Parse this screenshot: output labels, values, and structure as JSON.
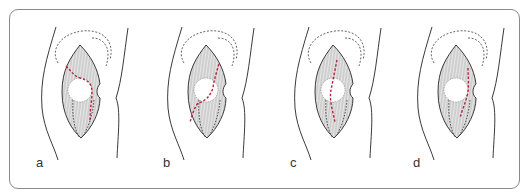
{
  "figure": {
    "panels": [
      {
        "id": "a",
        "label": "a",
        "offset_x": 0
      },
      {
        "id": "b",
        "label": "b",
        "offset_x": 126
      },
      {
        "id": "c",
        "label": "c",
        "offset_x": 253
      },
      {
        "id": "d",
        "label": "d",
        "offset_x": 376
      }
    ],
    "colors": {
      "frame": "#8a8a8a",
      "outline": "#3a3a3a",
      "hatch": "#9a9a9a",
      "fill": "#e4e4e4",
      "incision": "#b3263a",
      "dotted": "#555555"
    }
  }
}
